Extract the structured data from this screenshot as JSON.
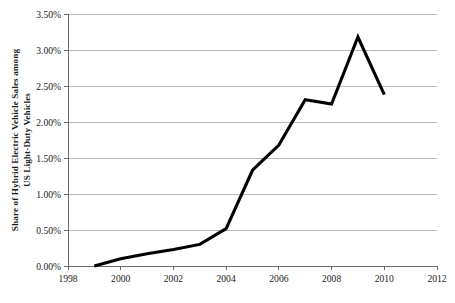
{
  "chart_data": {
    "type": "line",
    "title": "",
    "xlabel": "",
    "ylabel": "Share of Hybrid Electric Vehicle Sales among US Light-Duty Vehicles",
    "ylabel_lines": [
      "Share of Hybrid Electric Vehicle Sales among",
      "US Light-Duty Vehicles"
    ],
    "x": [
      1999,
      2000,
      2001,
      2002,
      2003,
      2004,
      2005,
      2006,
      2007,
      2008,
      2009,
      2010
    ],
    "values": [
      0.0,
      0.1,
      0.17,
      0.23,
      0.3,
      0.52,
      1.33,
      1.68,
      2.31,
      2.25,
      3.18,
      2.38
    ],
    "series": [
      {
        "name": "Share of Hybrid Electric Vehicle Sales among US Light-Duty Vehicles",
        "values": [
          0.0,
          0.1,
          0.17,
          0.23,
          0.3,
          0.52,
          1.33,
          1.68,
          2.31,
          2.25,
          3.18,
          2.38
        ]
      }
    ],
    "xlim": [
      1998,
      2012
    ],
    "ylim": [
      0,
      3.5
    ],
    "xticks": [
      1998,
      2000,
      2002,
      2004,
      2006,
      2008,
      2010,
      2012
    ],
    "xtick_labels": [
      "1998",
      "2000",
      "2002",
      "2004",
      "2006",
      "2008",
      "2010",
      "2012"
    ],
    "yticks": [
      0,
      0.5,
      1.0,
      1.5,
      2.0,
      2.5,
      3.0,
      3.5
    ],
    "ytick_labels": [
      "0.00%",
      "0.50%",
      "1.00%",
      "1.50%",
      "2.00%",
      "2.50%",
      "3.00%",
      "3.50%"
    ],
    "grid": "horizontal",
    "legend": "none",
    "line_color": "#000000",
    "grid_color": "#9a9a9a",
    "axis_color": "#5a5a5a",
    "background_color": "#ffffff"
  }
}
